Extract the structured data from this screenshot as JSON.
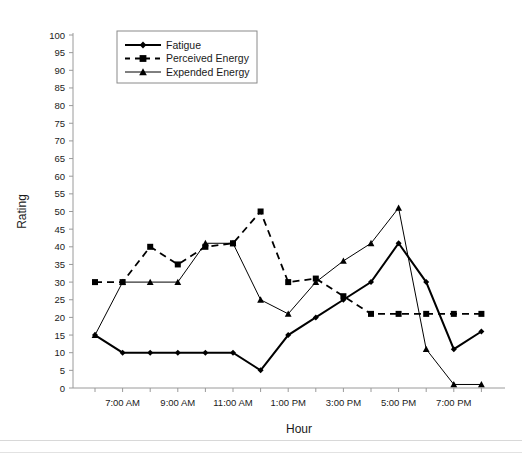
{
  "chart_data": {
    "type": "line",
    "title": "",
    "xlabel": "Hour",
    "ylabel": "Rating",
    "ylim": [
      0,
      100
    ],
    "ytick_step": 5,
    "yticks": [
      0,
      5,
      10,
      15,
      20,
      25,
      30,
      35,
      40,
      45,
      50,
      55,
      60,
      65,
      70,
      75,
      80,
      85,
      90,
      95,
      100
    ],
    "grid": false,
    "legend_position": "top-left-inside",
    "x": [
      "6:00 AM",
      "7:00 AM",
      "8:00 AM",
      "9:00 AM",
      "10:00 AM",
      "11:00 AM",
      "12:00 PM",
      "1:00 PM",
      "2:00 PM",
      "3:00 PM",
      "4:00 PM",
      "5:00 PM",
      "6:00 PM",
      "7:00 PM",
      "8:00 PM"
    ],
    "xticklabels": [
      "7:00 AM",
      "9:00 AM",
      "11:00 AM",
      "1:00 PM",
      "3:00 PM",
      "5:00 PM",
      "7:00 PM"
    ],
    "xticklabel_index": [
      1,
      3,
      5,
      7,
      9,
      11,
      13
    ],
    "series": [
      {
        "name": "Fatigue",
        "marker": "diamond",
        "dash": "solid",
        "color": "#000000",
        "values": [
          15,
          10,
          10,
          10,
          10,
          10,
          5,
          15,
          20,
          25,
          30,
          41,
          30,
          11,
          16
        ]
      },
      {
        "name": "Perceived Energy",
        "marker": "square",
        "dash": "dashed",
        "color": "#000000",
        "values": [
          30,
          30,
          40,
          35,
          40,
          41,
          50,
          30,
          31,
          26,
          21,
          21,
          21,
          21,
          21
        ]
      },
      {
        "name": "Expended Energy",
        "marker": "triangle",
        "dash": "solid",
        "color": "#000000",
        "values": [
          15,
          30,
          30,
          30,
          41,
          41,
          25,
          21,
          30,
          36,
          41,
          51,
          11,
          1,
          1
        ]
      }
    ]
  },
  "legend": {
    "items": [
      {
        "label": "Fatigue"
      },
      {
        "label": "Perceived Energy"
      },
      {
        "label": "Expended Energy"
      }
    ]
  },
  "axes": {
    "y_title": "Rating",
    "x_title": "Hour"
  }
}
